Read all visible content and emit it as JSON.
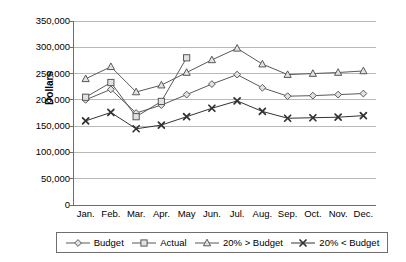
{
  "chart_data": {
    "type": "line",
    "title": "",
    "xlabel": "",
    "ylabel": "Dollars",
    "ylim": [
      0,
      350000
    ],
    "ytick_step": 50000,
    "grid": true,
    "legend_position": "bottom",
    "categories": [
      "Jan.",
      "Feb.",
      "Mar.",
      "Apr.",
      "May",
      "Jun.",
      "Jul.",
      "Aug.",
      "Sep.",
      "Oct.",
      "Nov.",
      "Dec."
    ],
    "ytick_labels": [
      "350,000",
      "300,000",
      "250,000",
      "200,000",
      "150,000",
      "100,000",
      "50,000",
      "0"
    ],
    "ytick_values": [
      350000,
      300000,
      250000,
      200000,
      150000,
      100000,
      50000,
      0
    ],
    "series": [
      {
        "name": "Budget",
        "marker": "diamond",
        "color": "#595959",
        "values": [
          200000,
          220000,
          175000,
          190000,
          210000,
          230000,
          248000,
          223000,
          207000,
          208000,
          210000,
          212000
        ]
      },
      {
        "name": "Actual",
        "marker": "square",
        "color": "#595959",
        "values": [
          205000,
          233000,
          168000,
          197000,
          280000,
          null,
          null,
          null,
          null,
          null,
          null,
          null
        ]
      },
      {
        "name": "20% > Budget",
        "marker": "triangle",
        "color": "#595959",
        "values": [
          240000,
          263000,
          215000,
          228000,
          252000,
          276000,
          298000,
          268000,
          248000,
          250000,
          252000,
          255000
        ]
      },
      {
        "name": "20% < Budget",
        "marker": "x",
        "color": "#333333",
        "values": [
          160000,
          176000,
          145000,
          152000,
          168000,
          184000,
          198000,
          178000,
          165000,
          166000,
          167000,
          170000
        ]
      }
    ]
  },
  "legend": {
    "items": [
      {
        "label": "Budget",
        "marker": "diamond"
      },
      {
        "label": "Actual",
        "marker": "square"
      },
      {
        "label": "20% > Budget",
        "marker": "triangle"
      },
      {
        "label": "20% < Budget",
        "marker": "x"
      }
    ]
  },
  "axis": {
    "y_title": "Dollars"
  },
  "colors": {
    "axis": "#6e6e6e",
    "grid": "#b9b9b9",
    "line": "#595959",
    "line_dark": "#333333",
    "marker_fill": "#e2e2e2",
    "text": "#000000"
  }
}
